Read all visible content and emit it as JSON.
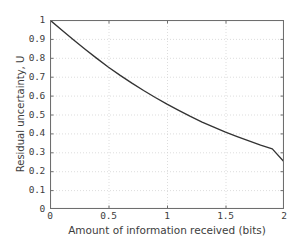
{
  "chart_data": {
    "type": "line",
    "title": "",
    "xlabel": "Amount of information received (bits)",
    "ylabel": "Residual uncertainty, U",
    "xlim": [
      0,
      2
    ],
    "ylim": [
      0,
      1
    ],
    "grid": true,
    "legend": null,
    "xticks": [
      "0",
      "0.5",
      "1",
      "1.5",
      "2"
    ],
    "xtick_values": [
      0,
      0.5,
      1,
      1.5,
      2
    ],
    "yticks": [
      "0",
      "0.1",
      "0.2",
      "0.3",
      "0.4",
      "0.5",
      "0.6",
      "0.7",
      "0.8",
      "0.9",
      "1"
    ],
    "ytick_values": [
      0,
      0.1,
      0.2,
      0.3,
      0.4,
      0.5,
      0.6,
      0.7,
      0.8,
      0.9,
      1
    ],
    "series": [
      {
        "name": "Residual uncertainty",
        "color": "#333333",
        "x": [
          0,
          0.1,
          0.2,
          0.3,
          0.4,
          0.5,
          0.6,
          0.7,
          0.8,
          0.9,
          1,
          1.1,
          1.2,
          1.3,
          1.4,
          1.5,
          1.6,
          1.7,
          1.8,
          1.9,
          2
        ],
        "values": [
          1.0,
          0.947,
          0.895,
          0.845,
          0.797,
          0.75,
          0.707,
          0.666,
          0.627,
          0.59,
          0.555,
          0.522,
          0.49,
          0.46,
          0.433,
          0.407,
          0.383,
          0.36,
          0.338,
          0.318,
          0.25
        ]
      }
    ]
  },
  "axis": {
    "ylabel": "Residual uncertainty, U",
    "xlabel": "Amount of information received (bits)"
  },
  "style": {
    "frame_color": "#6e6e6e",
    "grid_color": "#cfcfcf",
    "curve_color": "#2e2e2e",
    "text_color": "#3d3d3d",
    "background": "#ffffff"
  }
}
